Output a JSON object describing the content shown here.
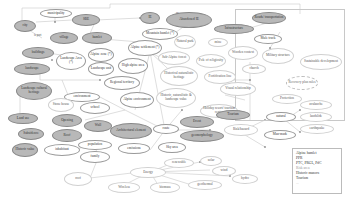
{
  "diagram": {
    "title": "",
    "nodes": [
      {
        "id": "municipality",
        "label": "municipality",
        "style": "white"
      },
      {
        "id": "city",
        "label": "city",
        "style": "gray"
      },
      {
        "id": "sbe",
        "label": "SBE",
        "style": "gray"
      },
      {
        "id": "ie",
        "label": "IE",
        "style": "gray"
      },
      {
        "id": "abandoned_ie",
        "label": "Abandoned IE",
        "style": "gray"
      },
      {
        "id": "roads",
        "label": "Roads/ transportation",
        "style": "gray"
      },
      {
        "id": "village",
        "label": "village",
        "style": "gray"
      },
      {
        "id": "hamlet",
        "label": "hamlet",
        "style": "gray"
      },
      {
        "id": "mountain_hamlet",
        "label": "Mountain hamlet (*)",
        "style": "white"
      },
      {
        "id": "infrastructure",
        "label": "Infrastructure",
        "style": "gray"
      },
      {
        "id": "buildings",
        "label": "buildings",
        "style": "gray"
      },
      {
        "id": "landscape_area",
        "label": "Landscape Area (*)",
        "style": "white"
      },
      {
        "id": "alpine_zone",
        "label": "Alpine zone (*)",
        "style": "white"
      },
      {
        "id": "alpine_settlement",
        "label": "Alpine settlement (*)",
        "style": "white"
      },
      {
        "id": "natural_park",
        "label": "Natural park",
        "style": "faint"
      },
      {
        "id": "mine",
        "label": "mine",
        "style": "faint"
      },
      {
        "id": "mule_track",
        "label": "Mule track",
        "style": "white"
      },
      {
        "id": "landscape_unit",
        "label": "Landscape unit",
        "style": "white"
      },
      {
        "id": "high_alpine_area",
        "label": "High alpine area",
        "style": "white"
      },
      {
        "id": "sub_alpine_forest",
        "label": "Sub-Alpine forest",
        "style": "faint"
      },
      {
        "id": "pole_of_religiosity",
        "label": "Pole of religiosity",
        "style": "faint"
      },
      {
        "id": "wooden_context",
        "label": "Wooden context",
        "style": "faint"
      },
      {
        "id": "military_structure",
        "label": "Military structure",
        "style": "faint"
      },
      {
        "id": "sustainable_development",
        "label": "Sustainable development",
        "style": "faint"
      },
      {
        "id": "landscape",
        "label": "landscape",
        "style": "gray"
      },
      {
        "id": "landscape_cultural_heritage",
        "label": "Landscape cultural heritage",
        "style": "gray"
      },
      {
        "id": "regional_territory",
        "label": "Regional territory",
        "style": "white"
      },
      {
        "id": "historical_naturalistic_heritage",
        "label": "Historical naturalistic heritage",
        "style": "faint"
      },
      {
        "id": "fortification_line",
        "label": "Fortification line",
        "style": "faint"
      },
      {
        "id": "church",
        "label": "church",
        "style": "faint"
      },
      {
        "id": "recovery_plan_rules",
        "label": "Recovery plan rules",
        "style": "dashed"
      },
      {
        "id": "environment",
        "label": "environment",
        "style": "white"
      },
      {
        "id": "alpine_environment",
        "label": "Alpine environment",
        "style": "white"
      },
      {
        "id": "historic_naturalistic_landscape_value",
        "label": "Historic, naturalistic & landscape value",
        "style": "faint"
      },
      {
        "id": "visual_relationship",
        "label": "Visual relationship",
        "style": "faint"
      },
      {
        "id": "protection",
        "label": "Protection",
        "style": "faint"
      },
      {
        "id": "stone_house",
        "label": "Stone house",
        "style": "faint"
      },
      {
        "id": "school",
        "label": "school",
        "style": "white"
      },
      {
        "id": "holiday_resort",
        "label": "Holiday resort/ tourism center",
        "style": "faint"
      },
      {
        "id": "avalanche",
        "label": "avalanche",
        "style": "faint"
      },
      {
        "id": "land_use",
        "label": "Land use",
        "style": "gray"
      },
      {
        "id": "opening",
        "label": "Opening",
        "style": "gray"
      },
      {
        "id": "wall",
        "label": "Wall",
        "style": "gray"
      },
      {
        "id": "architectural_element",
        "label": "Architectural element",
        "style": "gray"
      },
      {
        "id": "route",
        "label": "route",
        "style": "white"
      },
      {
        "id": "tourism",
        "label": "Tourism",
        "style": "gray"
      },
      {
        "id": "event",
        "label": "Event",
        "style": "gray"
      },
      {
        "id": "natural",
        "label": "natural",
        "style": "white"
      },
      {
        "id": "landslide",
        "label": "landslide",
        "style": "faint"
      },
      {
        "id": "geomorphology",
        "label": "geomorphology",
        "style": "gray"
      },
      {
        "id": "risk_hazard",
        "label": "Risk/hazard",
        "style": "faint"
      },
      {
        "id": "earthquake",
        "label": "earthquake",
        "style": "faint"
      },
      {
        "id": "man_made",
        "label": "Man-made",
        "style": "white"
      },
      {
        "id": "subsidence",
        "label": "Subsidence",
        "style": "gray"
      },
      {
        "id": "roof",
        "label": "Roof",
        "style": "gray"
      },
      {
        "id": "population",
        "label": "population",
        "style": "white"
      },
      {
        "id": "historic_value",
        "label": "Historic value",
        "style": "gray"
      },
      {
        "id": "inhabitant",
        "label": "inhabitant",
        "style": "white"
      },
      {
        "id": "family",
        "label": "family",
        "style": "white"
      },
      {
        "id": "emissions",
        "label": "emissions",
        "style": "white"
      },
      {
        "id": "sky_area",
        "label": "Sky area",
        "style": "white"
      },
      {
        "id": "renewable",
        "label": "renewable",
        "style": "faint"
      },
      {
        "id": "solar",
        "label": "solar",
        "style": "faint"
      },
      {
        "id": "energy",
        "label": "Energy",
        "style": "faint"
      },
      {
        "id": "wind",
        "label": "wind",
        "style": "faint"
      },
      {
        "id": "roof_bottom",
        "label": "roof",
        "style": "faint"
      },
      {
        "id": "hydro",
        "label": "hydro",
        "style": "faint"
      },
      {
        "id": "wireless",
        "label": "Wireless",
        "style": "faint"
      },
      {
        "id": "biomass",
        "label": "biomass",
        "style": "faint"
      },
      {
        "id": "geothermal",
        "label": "geothermal",
        "style": "faint"
      }
    ],
    "edge_labels": {
      "city_village": "is part",
      "sbe_ie": "IE"
    }
  },
  "legend": {
    "items": [
      "Alpine hamlet",
      "PPR",
      "PTC, PRGL, PdC",
      "Risk area",
      "Historic manors",
      "Tourism",
      "..."
    ]
  }
}
